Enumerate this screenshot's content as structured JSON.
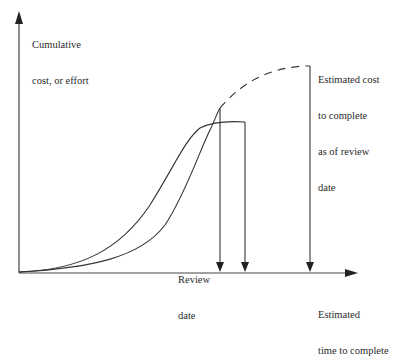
{
  "diagram": {
    "type": "cumulative cost vs time (S-curves)",
    "y_axis_label_line1": "Cumulative",
    "y_axis_label_line2": "cost, or effort",
    "x_axis_label_line1": "Estimated",
    "x_axis_label_line2": "time to complete",
    "review_label_line1": "Review",
    "review_label_line2": "date",
    "estimate_label_line1": "Estimated cost",
    "estimate_label_line2": "to complete",
    "estimate_label_line3": "as of review",
    "estimate_label_line4": "date",
    "colors": {
      "line": "#333333",
      "background": "#ffffff"
    },
    "elements": [
      {
        "id": "planned-curve",
        "style": "solid",
        "description": "S-curve rising early, flattening to end point near x=245"
      },
      {
        "id": "actual-curve",
        "style": "solid",
        "description": "steeper S-curve up to review date peak near x=220"
      },
      {
        "id": "forecast-curve",
        "style": "dashed",
        "description": "extrapolation from review date to estimated completion near x=310"
      },
      {
        "id": "review-date-marker",
        "style": "arrow down"
      },
      {
        "id": "planned-completion-marker",
        "style": "arrow down"
      },
      {
        "id": "estimated-completion-marker",
        "style": "arrow down"
      }
    ]
  }
}
